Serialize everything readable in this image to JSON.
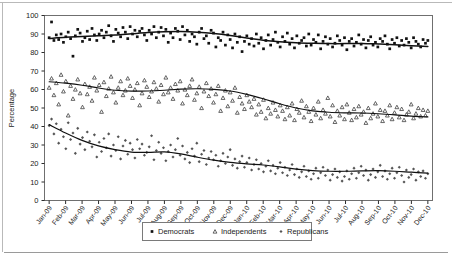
{
  "chart_data": {
    "type": "scatter",
    "title": "",
    "subtitle": "",
    "xlabel": "",
    "ylabel": "Percentage",
    "ylim": [
      0,
      100
    ],
    "ytick_step": 10,
    "yticks": [
      0,
      10,
      20,
      30,
      40,
      50,
      60,
      70,
      80,
      90,
      100
    ],
    "grid": false,
    "legend_position": "bottom-center",
    "categories": [
      "Jan-09",
      "Feb-09",
      "Mar-09",
      "Apr-09",
      "May-09",
      "Jun-09",
      "Jul-09",
      "Aug-09",
      "Sep-09",
      "Oct-09",
      "Nov-09",
      "Dec-09",
      "Jan-10",
      "Feb-10",
      "Mar-10",
      "Apr-10",
      "May-10",
      "Jun-10",
      "Jul-10",
      "Aug-10",
      "Sep-10",
      "Oct-10",
      "Nov-10",
      "Dec-10"
    ],
    "series": [
      {
        "name": "Democrats",
        "marker": "square",
        "color": "#111111",
        "trend_values": [
          87.6,
          88.2,
          88.6,
          89.0,
          89.4,
          90.1,
          90.8,
          91.2,
          91.3,
          91.0,
          90.3,
          89.2,
          87.8,
          86.6,
          85.8,
          85.3,
          85.0,
          84.8,
          84.8,
          84.9,
          84.6,
          84.2,
          83.7,
          83.3
        ],
        "scatter_values": [
          88.0,
          96.5,
          86.5,
          89.5,
          87.0,
          90.0,
          85.5,
          88.5,
          91.0,
          87.5,
          78.0,
          89.0,
          92.5,
          90.5,
          86.0,
          88.0,
          91.5,
          87.0,
          93.0,
          89.5,
          86.5,
          90.0,
          92.0,
          88.0,
          91.0,
          94.5,
          89.0,
          86.0,
          92.5,
          90.5,
          88.5,
          93.5,
          91.0,
          87.5,
          94.0,
          90.0,
          92.0,
          88.5,
          91.5,
          93.0,
          89.5,
          86.5,
          92.0,
          90.0,
          94.0,
          88.0,
          91.0,
          93.5,
          89.0,
          92.5,
          85.5,
          90.5,
          88.0,
          93.0,
          91.5,
          87.0,
          94.0,
          89.5,
          92.0,
          86.0,
          90.0,
          88.5,
          84.5,
          91.0,
          93.0,
          87.5,
          89.0,
          85.0,
          92.0,
          90.5,
          83.0,
          88.0,
          86.5,
          91.0,
          84.0,
          89.5,
          87.0,
          82.5,
          90.0,
          85.5,
          88.5,
          80.5,
          86.0,
          89.0,
          84.5,
          87.5,
          83.5,
          90.0,
          85.0,
          88.0,
          82.0,
          86.5,
          89.5,
          84.0,
          87.0,
          91.0,
          85.5,
          83.0,
          88.5,
          86.0,
          90.5,
          84.5,
          87.5,
          82.5,
          89.0,
          85.0,
          86.5,
          88.0,
          83.5,
          90.0,
          84.0,
          87.0,
          85.5,
          89.5,
          82.0,
          86.0,
          88.5,
          84.5,
          87.5,
          83.0,
          85.0,
          89.0,
          86.5,
          84.0,
          88.0,
          81.5,
          86.0,
          87.5,
          83.5,
          85.5,
          89.5,
          84.5,
          87.0,
          82.5,
          86.5,
          88.5,
          84.0,
          85.5,
          83.0,
          87.5,
          86.0,
          89.0,
          84.5,
          82.0,
          87.0,
          85.0,
          88.0,
          83.5,
          86.5,
          84.0,
          87.5,
          85.5,
          82.5,
          88.0,
          86.0,
          84.5,
          83.0,
          87.0,
          85.0,
          86.5
        ]
      },
      {
        "name": "Independents",
        "marker": "triangle",
        "color": "#4a4a4a",
        "trend_values": [
          64.2,
          63.4,
          62.3,
          60.8,
          59.6,
          59.1,
          59.2,
          59.6,
          60.2,
          60.4,
          60.1,
          59.2,
          57.4,
          55.0,
          52.3,
          50.0,
          48.5,
          47.7,
          47.4,
          47.3,
          46.9,
          46.3,
          45.6,
          45.2
        ],
        "scatter_values": [
          61.0,
          66.0,
          57.0,
          63.5,
          52.0,
          68.0,
          59.0,
          64.5,
          46.0,
          62.0,
          55.0,
          60.0,
          65.5,
          58.0,
          50.5,
          63.0,
          57.5,
          61.5,
          54.0,
          66.5,
          59.5,
          62.5,
          48.0,
          64.0,
          56.5,
          60.5,
          67.0,
          58.5,
          53.0,
          61.0,
          64.5,
          57.0,
          59.5,
          66.0,
          62.0,
          55.5,
          60.0,
          63.5,
          51.5,
          58.0,
          65.0,
          61.5,
          56.0,
          59.0,
          64.0,
          60.5,
          53.5,
          62.5,
          57.5,
          66.5,
          58.5,
          61.0,
          55.0,
          63.0,
          59.5,
          64.5,
          52.5,
          60.0,
          57.0,
          62.0,
          65.5,
          54.5,
          58.0,
          61.5,
          50.0,
          59.0,
          63.5,
          56.5,
          60.5,
          53.0,
          57.5,
          62.0,
          48.5,
          55.5,
          59.5,
          51.0,
          58.5,
          54.0,
          61.0,
          47.5,
          56.0,
          52.5,
          49.5,
          57.0,
          53.5,
          50.5,
          55.0,
          46.5,
          52.0,
          48.0,
          54.5,
          44.5,
          50.0,
          47.0,
          53.0,
          49.0,
          45.5,
          51.5,
          48.5,
          44.0,
          50.5,
          46.0,
          52.5,
          43.5,
          49.5,
          47.5,
          54.0,
          45.0,
          51.0,
          48.0,
          43.0,
          50.0,
          46.5,
          53.5,
          44.5,
          49.0,
          47.0,
          55.5,
          45.5,
          51.5,
          42.5,
          48.5,
          46.0,
          50.5,
          44.0,
          52.0,
          47.5,
          43.5,
          49.5,
          45.0,
          51.0,
          46.5,
          48.0,
          42.0,
          50.0,
          44.5,
          47.0,
          52.5,
          45.5,
          49.0,
          43.0,
          48.5,
          46.0,
          51.5,
          44.0,
          47.5,
          50.5,
          45.0,
          49.5,
          43.5,
          46.5,
          48.0,
          52.0,
          44.5,
          47.0,
          50.0,
          45.5,
          49.0,
          46.0,
          48.5
        ]
      },
      {
        "name": "Republicans",
        "marker": "diamond",
        "color": "#555555",
        "trend_values": [
          41.0,
          36.5,
          32.5,
          29.5,
          27.5,
          26.2,
          26.0,
          26.3,
          25.2,
          23.4,
          21.8,
          20.6,
          19.8,
          19.2,
          18.2,
          17.0,
          16.2,
          15.8,
          15.8,
          16.0,
          16.1,
          15.8,
          15.3,
          14.8
        ],
        "scatter_values": [
          40.5,
          44.0,
          36.0,
          41.5,
          31.0,
          38.5,
          34.5,
          28.0,
          42.0,
          33.0,
          36.5,
          25.5,
          39.0,
          30.5,
          34.0,
          27.5,
          37.0,
          32.0,
          29.0,
          35.5,
          23.5,
          31.5,
          26.5,
          33.5,
          28.5,
          36.0,
          24.0,
          30.0,
          27.0,
          34.5,
          22.5,
          29.5,
          32.5,
          25.0,
          31.0,
          27.5,
          23.0,
          33.0,
          28.0,
          30.5,
          24.5,
          26.0,
          29.0,
          35.0,
          22.0,
          27.0,
          31.5,
          25.5,
          28.5,
          21.5,
          26.5,
          30.0,
          23.5,
          27.5,
          33.5,
          24.5,
          29.5,
          22.5,
          26.0,
          20.5,
          28.0,
          24.0,
          31.0,
          21.0,
          25.0,
          27.0,
          19.5,
          23.0,
          26.5,
          22.0,
          24.5,
          18.5,
          21.5,
          25.5,
          20.0,
          23.5,
          27.5,
          19.0,
          22.5,
          17.5,
          21.0,
          24.0,
          18.0,
          20.5,
          23.0,
          16.5,
          19.5,
          22.0,
          17.0,
          20.0,
          15.5,
          18.5,
          21.5,
          16.0,
          19.0,
          14.5,
          17.5,
          20.5,
          15.0,
          18.0,
          13.5,
          16.5,
          19.5,
          14.0,
          17.0,
          12.5,
          15.5,
          18.5,
          13.0,
          16.0,
          11.5,
          14.5,
          17.5,
          12.0,
          15.0,
          18.0,
          13.5,
          16.5,
          11.0,
          14.0,
          17.0,
          12.5,
          15.5,
          10.5,
          13.0,
          16.0,
          11.5,
          14.5,
          17.5,
          12.0,
          15.0,
          18.5,
          13.5,
          16.5,
          11.0,
          14.0,
          17.0,
          12.5,
          15.5,
          19.0,
          13.0,
          16.0,
          11.5,
          14.5,
          17.5,
          12.0,
          15.0,
          18.0,
          13.5,
          10.0,
          16.5,
          12.5,
          14.0,
          17.0,
          11.0,
          15.5,
          13.0,
          16.0,
          12.0,
          14.5
        ]
      }
    ]
  },
  "legend": {
    "items": [
      {
        "label": "Democrats",
        "marker": "square"
      },
      {
        "label": "Independents",
        "marker": "triangle"
      },
      {
        "label": "Republicans",
        "marker": "diamond"
      }
    ]
  },
  "axis": {
    "y_title": "Percentage"
  },
  "colors": {
    "axis": "#2b2b2b",
    "frame": "#7a7a7a",
    "rule": "#b9b9b9",
    "text": "#1a1a1a"
  }
}
